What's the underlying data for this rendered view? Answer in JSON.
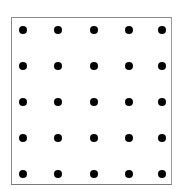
{
  "diagram": {
    "type": "dot-grid",
    "rows": 5,
    "columns": 5,
    "dot_color": "#000000",
    "frame_color": "#8a8a8a",
    "column_x": [
      23,
      58,
      94,
      129,
      162
    ],
    "row_y": [
      30,
      66,
      102,
      138,
      174
    ]
  }
}
